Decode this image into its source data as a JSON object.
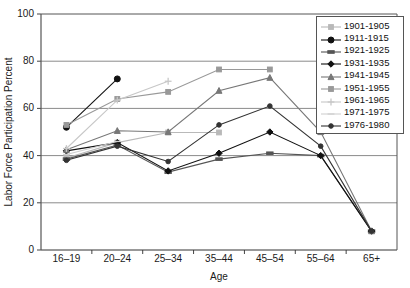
{
  "chart_data": {
    "type": "line",
    "title": "",
    "xlabel": "Age",
    "ylabel": "Labor Force Participation Percent",
    "categories": [
      "16–19",
      "20–24",
      "25–34",
      "35–44",
      "45–54",
      "55–64",
      "65+"
    ],
    "ylim": [
      0,
      100
    ],
    "yticks": [
      0,
      20,
      40,
      60,
      80,
      100
    ],
    "grid": "horizontal",
    "legend_position": "top-right",
    "series": [
      {
        "name": "1901-1905",
        "marker": "square-light",
        "color": "#b9b9b9",
        "values": [
          39,
          45.5,
          49.8,
          49.8,
          null,
          null,
          null
        ]
      },
      {
        "name": "1911-1915",
        "marker": "circle-filled",
        "color": "#111111",
        "values": [
          52,
          72.5,
          null,
          null,
          null,
          null,
          null
        ]
      },
      {
        "name": "1921-1925",
        "marker": "dash-dark",
        "color": "#555555",
        "values": [
          38.5,
          44.5,
          33,
          38.5,
          41,
          40,
          8
        ]
      },
      {
        "name": "1931-1935",
        "marker": "diamond-filled",
        "color": "#111111",
        "values": [
          42,
          45.5,
          33.5,
          41,
          50,
          40,
          8
        ]
      },
      {
        "name": "1941-1945",
        "marker": "triangle",
        "color": "#777777",
        "values": [
          42.5,
          50.5,
          50,
          67.5,
          73,
          50,
          8
        ]
      },
      {
        "name": "1951-1955",
        "marker": "square-gray",
        "color": "#999999",
        "values": [
          53,
          64,
          67,
          76.5,
          76.5,
          null,
          null
        ]
      },
      {
        "name": "1961-1965",
        "marker": "plus-light",
        "color": "#c7c7c7",
        "values": [
          43,
          63.5,
          71.5,
          null,
          null,
          null,
          null
        ]
      },
      {
        "name": "1971-1975",
        "marker": "line-light",
        "color": "#cfcfcf",
        "values": [
          40.5,
          46,
          null,
          null,
          null,
          null,
          null
        ]
      },
      {
        "name": "1976-1980",
        "marker": "circle-small",
        "color": "#333333",
        "values": [
          38,
          44,
          37.5,
          53,
          61,
          44,
          8
        ]
      }
    ]
  }
}
